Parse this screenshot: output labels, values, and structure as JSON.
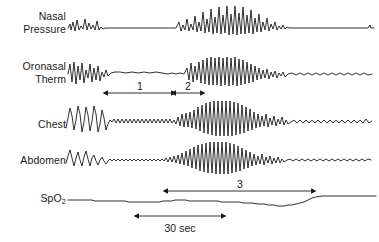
{
  "figure": {
    "type": "polysomnography-trace",
    "width": 379,
    "height": 242,
    "background_color": "#ffffff",
    "trace_color": "#1a1a1a"
  },
  "channels": [
    {
      "id": "nasal-pressure",
      "label": "Nasal\nPressure",
      "label_y": 10,
      "baseline_y": 28,
      "description": "Flattened/absent airflow signal during apnea followed by crescendo recovery breaths, then return to flat."
    },
    {
      "id": "oronasal-therm",
      "label": "Oronasal\nTherm",
      "label_y": 60,
      "baseline_y": 74,
      "description": "Thermistor airflow: oscillations, flat apnea segment, then large recovery breaths."
    },
    {
      "id": "chest",
      "label": "Chest",
      "label_y": 118,
      "baseline_y": 122,
      "description": "Respiratory effort belt: large excursions, reduced low-amplitude effort, crescendo, then small ripples."
    },
    {
      "id": "abdomen",
      "label": "Abdomen",
      "label_y": 154,
      "baseline_y": 160,
      "description": "Abdominal effort belt mirroring chest with reduced amplitude plateau and crescendo recovery."
    },
    {
      "id": "spo2",
      "label": "SpO<sub>2</sub>",
      "label_y": 192,
      "baseline_y": 200,
      "description": "Oxygen saturation showing gradual decline, desaturation nadir, then recovery to higher plateau."
    }
  ],
  "annotations": [
    {
      "id": "interval-1",
      "label": "1",
      "x1": 108,
      "x2": 172,
      "y": 93,
      "label_x": 140,
      "label_y": 80
    },
    {
      "id": "interval-2",
      "label": "2",
      "x1": 176,
      "x2": 201,
      "y": 93,
      "label_x": 188,
      "label_y": 80
    },
    {
      "id": "interval-3",
      "label": "3",
      "x1": 168,
      "x2": 312,
      "y": 191,
      "label_x": 240,
      "label_y": 178
    }
  ],
  "scale_bar": {
    "id": "time-scale",
    "label": "30 sec",
    "x1": 139,
    "x2": 222,
    "y": 216,
    "label_x": 180,
    "label_y": 223
  },
  "chart_data": {
    "type": "line",
    "title": "",
    "xlabel": "",
    "ylabel": "",
    "grid": false,
    "legend": "none",
    "x_scale_reference": {
      "label": "30 sec",
      "pixel_span": 83
    },
    "series": [
      {
        "name": "Nasal Pressure",
        "baseline": 28,
        "points": "68,28 70,24 71,30 73,22 75,31 77,20 79,30 81,26 83,29 85,19 87,30 89,23 91,29 93,25 95,30 97,21 99,30 101,27 103,29 105,28 108,28 115,28 125,28 140,28 155,28 170,28 176,28 179,22 181,31 183,25 185,30 187,19 189,31 191,24 193,30 195,16 197,32 199,22 201,31 203,12 205,33 207,19 209,32 211,9 213,34 215,17 217,33 219,7 221,34 223,15 225,33 227,6 229,35 231,14 233,34 235,6 237,35 239,13 241,34 243,7 245,34 247,15 249,33 251,10 253,34 255,18 257,32 259,14 261,32 263,22 265,30 267,18 269,31 271,24 273,29 275,22 277,30 279,26 281,29 283,25 285,29 287,27 289,28 292,28 300,28 315,28 330,28 345,28 360,28 368,28 370,25 371,28 374,28"
      },
      {
        "name": "Oronasal Therm",
        "baseline": 74,
        "points": "68,74 70,64 72,82 74,62 76,84 78,66 80,80 82,63 84,83 86,70 88,78 90,64 92,82 94,68 96,80 98,66 100,81 102,72 104,77 106,70 108,76 111,73 115,72 120,72 126,73 132,72 138,73 144,72 150,73 156,72 162,73 168,74 172,73 176,74 180,73 184,74 187,68 189,80 191,63 193,82 195,66 197,80 199,62 201,83 203,60 205,84 207,58 209,85 211,57 213,85 215,58 217,85 219,57 221,86 223,58 225,85 227,57 229,86 231,58 233,85 235,57 237,86 239,59 241,85 243,60 245,84 247,62 249,83 251,64 253,82 255,66 257,80 259,68 261,79 263,70 265,78 267,69 269,79 271,72 273,77 275,71 277,78 279,73 281,76 283,72 285,77 288,74 292,73 296,75 300,73 304,75 308,73 312,75 316,73 320,75 324,73 328,75 332,73 336,75 340,73 344,75 348,73 352,75 356,73 360,75 364,73 368,75 372,74"
      },
      {
        "name": "Chest",
        "baseline": 122,
        "points": "66,128 68,118 70,108 72,116 74,130 76,120 78,106 80,114 82,132 84,122 86,107 88,115 90,131 92,121 94,106 96,114 98,132 100,124 102,110 104,118 106,130 108,124 110,120 112,122 114,119 116,123 118,119 120,123 122,119 124,123 126,119 128,123 130,119 132,123 134,119 136,123 138,119 140,123 142,119 144,123 146,119 148,123 150,119 152,123 154,119 156,123 158,119 160,123 162,119 164,123 166,119 168,123 170,119 172,123 174,120 176,124 178,117 180,126 182,114 184,127 186,113 188,127 190,112 192,128 194,110 196,129 198,107 200,131 202,105 204,133 206,103 208,134 210,102 212,135 214,101 216,136 218,101 220,136 222,101 224,136 226,101 228,136 230,101 232,136 234,102 236,135 238,103 240,134 242,105 244,133 246,107 248,131 250,109 252,130 254,112 256,128 258,114 260,127 262,116 264,126 266,114 268,127 270,118 272,125 274,116 276,126 278,119 280,124 282,117 284,125 286,120 288,124 291,122 294,120 297,123 300,120 303,123 306,120 309,123 312,120 315,123 318,120 321,123 324,120 327,123 330,120 333,123 336,120 339,123 342,120 345,123 348,120 351,123 354,120 357,123 360,120 363,123 366,119 369,123 372,121"
      },
      {
        "name": "Abdomen",
        "baseline": 160,
        "points": "66,163 68,156 70,150 72,158 74,166 76,158 78,152 80,160 82,166 84,157 86,151 88,159 90,166 92,158 94,155 96,161 98,165 100,160 102,157 104,161 106,164 108,161 110,159 112,161 114,159 116,161 118,159 120,161 122,159 124,161 126,159 128,161 130,159 132,161 134,159 136,161 138,159 140,161 142,159 144,161 146,159 148,161 150,159 152,161 154,159 156,161 158,159 160,161 162,159 164,161 166,158 168,162 170,157 172,162 174,156 176,163 178,155 180,164 182,153 184,165 186,151 188,166 190,149 192,168 194,147 196,169 198,145 200,171 202,144 204,172 206,143 208,173 210,142 212,173 214,142 216,174 218,142 220,174 222,142 224,174 226,142 228,174 230,143 232,173 234,144 236,172 238,146 240,171 242,148 244,169 246,150 248,168 250,152 252,166 254,154 256,165 258,156 260,164 262,154 264,165 266,157 268,163 270,156 272,164 274,158 276,163 278,157 280,163 282,159 284,162 287,160 290,159 293,161 296,159 299,161 302,159 305,161 308,159 311,161 314,159 317,161 320,159 323,161 326,159 329,161 332,159 335,161 338,159 341,161 344,159 347,161 350,159 353,161 356,159 359,161 362,159 365,161 368,159 371,160"
      },
      {
        "name": "SpO2",
        "baseline": 200,
        "points": "68,200 80,200 92,200 95,201 110,201 125,201 128,202 145,202 160,202 163,201 172,201 175,200 186,200 189,201 205,201 218,201 221,202 232,202 240,202 243,203 252,203 258,204 264,204 268,205 274,205 278,206 284,206 288,205 292,205 296,204 300,203 304,202 308,200 312,198 316,197 322,196 330,196 340,196 350,196 360,196 370,196 376,196"
      }
    ]
  }
}
